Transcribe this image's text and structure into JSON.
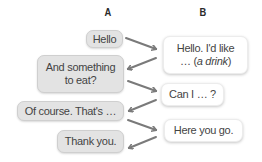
{
  "columns": {
    "a_label": "A",
    "b_label": "B"
  },
  "dialogue": {
    "a": [
      {
        "lines": [
          "Hello"
        ]
      },
      {
        "lines": [
          "And something",
          "to eat?"
        ]
      },
      {
        "lines": [
          "Of course. That's …"
        ]
      },
      {
        "lines": [
          "Thank you."
        ]
      }
    ],
    "b": [
      {
        "line1": "Hello. I'd like",
        "line2_prefix": "… (",
        "line2_italic": "a drink",
        "line2_suffix": ")"
      },
      {
        "lines": [
          "Can I … ?"
        ]
      },
      {
        "lines": [
          "Here you go."
        ]
      }
    ]
  },
  "colors": {
    "a_bubble_fill": "#e3e3e3",
    "a_bubble_border": "#cfcfcf",
    "b_bubble_fill": "#ffffff",
    "arrow": "#7a7a7a",
    "text": "#444444"
  },
  "arrows": [
    {
      "from": "A1",
      "to": "B1"
    },
    {
      "from": "B1",
      "to": "A2"
    },
    {
      "from": "A2",
      "to": "B2"
    },
    {
      "from": "B2",
      "to": "A3"
    },
    {
      "from": "A3",
      "to": "B3"
    },
    {
      "from": "B3",
      "to": "A4"
    }
  ]
}
